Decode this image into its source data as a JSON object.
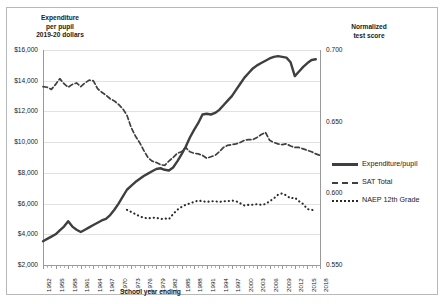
{
  "chart_data": {
    "type": "line",
    "title": "",
    "xlabel": "School year ending",
    "ylabel_left": "Expenditure\nper pupil\n2019-20 dollars",
    "ylabel_right": "Normalized\ntest score",
    "grid": true,
    "legend_position": "right",
    "x_tick_labels": [
      "1952",
      "1955",
      "1958",
      "1961",
      "1964",
      "1967",
      "1970",
      "1973",
      "1976",
      "1979",
      "1982",
      "1985",
      "1988",
      "1991",
      "1994",
      "1997",
      "2000",
      "2003",
      "2006",
      "2009",
      "2012",
      "2015",
      "2018"
    ],
    "xlim": [
      1952,
      2018
    ],
    "ylim_left": [
      2000,
      16000
    ],
    "ylim_right": [
      0.55,
      0.7
    ],
    "y_tick_labels_left": [
      "$16,000",
      "$14,000",
      "$12,000",
      "$10,000",
      "$8,000",
      "$6,000",
      "$4,000",
      "$2,000"
    ],
    "y_tick_values_left": [
      16000,
      14000,
      12000,
      10000,
      8000,
      6000,
      4000,
      2000
    ],
    "y_tick_labels_right": [
      "0.700",
      "0.650",
      "0.600",
      "0.550"
    ],
    "y_tick_values_right": [
      0.7,
      0.65,
      0.6,
      0.55
    ],
    "series": [
      {
        "name": "Expenditure/pupil",
        "axis": "left",
        "style": "solid",
        "color": "#3f3f3f",
        "x": [
          1952,
          1953,
          1954,
          1955,
          1956,
          1957,
          1958,
          1959,
          1960,
          1961,
          1962,
          1963,
          1964,
          1965,
          1966,
          1967,
          1968,
          1969,
          1970,
          1971,
          1972,
          1973,
          1974,
          1975,
          1976,
          1977,
          1978,
          1979,
          1980,
          1981,
          1982,
          1983,
          1984,
          1985,
          1986,
          1987,
          1988,
          1989,
          1990,
          1991,
          1992,
          1993,
          1994,
          1995,
          1996,
          1997,
          1998,
          1999,
          2000,
          2001,
          2002,
          2003,
          2004,
          2005,
          2006,
          2007,
          2008,
          2009,
          2010,
          2011,
          2012,
          2013,
          2014,
          2015,
          2016,
          2017
        ],
        "values": [
          3550,
          3700,
          3850,
          4000,
          4250,
          4500,
          4850,
          4500,
          4300,
          4150,
          4300,
          4450,
          4600,
          4750,
          4900,
          5000,
          5250,
          5600,
          6000,
          6450,
          6900,
          7150,
          7400,
          7600,
          7800,
          7950,
          8100,
          8250,
          8300,
          8200,
          8150,
          8350,
          8750,
          9200,
          9700,
          10300,
          10800,
          11250,
          11800,
          11850,
          11800,
          11900,
          12100,
          12400,
          12700,
          13000,
          13400,
          13800,
          14200,
          14500,
          14800,
          15000,
          15150,
          15300,
          15450,
          15550,
          15600,
          15550,
          15500,
          15200,
          14300,
          14600,
          14900,
          15150,
          15350,
          15400
        ]
      },
      {
        "name": "SAT Total",
        "axis": "right",
        "style": "dashed",
        "color": "#3f3f3f",
        "x": [
          1952,
          1953,
          1954,
          1955,
          1956,
          1957,
          1958,
          1959,
          1960,
          1961,
          1962,
          1963,
          1964,
          1965,
          1966,
          1967,
          1968,
          1969,
          1970,
          1971,
          1972,
          1973,
          1974,
          1975,
          1976,
          1977,
          1978,
          1979,
          1980,
          1981,
          1982,
          1983,
          1984,
          1985,
          1986,
          1987,
          1988,
          1989,
          1990,
          1991,
          1992,
          1993,
          1994,
          1995,
          1996,
          1997,
          1998,
          1999,
          2000,
          2001,
          2002,
          2003,
          2004,
          2005,
          2006,
          2007,
          2008,
          2009,
          2010,
          2011,
          2012,
          2013,
          2014,
          2015,
          2016,
          2017,
          2018
        ],
        "values": [
          0.6745,
          0.674,
          0.6725,
          0.676,
          0.68,
          0.6765,
          0.674,
          0.676,
          0.677,
          0.6745,
          0.677,
          0.679,
          0.6785,
          0.673,
          0.6705,
          0.6685,
          0.666,
          0.6645,
          0.662,
          0.659,
          0.6545,
          0.646,
          0.64,
          0.6355,
          0.63,
          0.625,
          0.6225,
          0.6215,
          0.62,
          0.6195,
          0.6225,
          0.625,
          0.628,
          0.629,
          0.632,
          0.629,
          0.628,
          0.6275,
          0.6265,
          0.6245,
          0.6255,
          0.6265,
          0.629,
          0.632,
          0.6335,
          0.634,
          0.6345,
          0.6355,
          0.637,
          0.6375,
          0.6375,
          0.639,
          0.641,
          0.6425,
          0.637,
          0.6355,
          0.6345,
          0.634,
          0.6345,
          0.633,
          0.632,
          0.632,
          0.631,
          0.63,
          0.629,
          0.6275,
          0.6265
        ]
      },
      {
        "name": "NAEP 12th Grade",
        "axis": "right",
        "style": "dotted",
        "color": "#2a2a2a",
        "x": [
          1972,
          1973,
          1974,
          1975,
          1976,
          1977,
          1978,
          1979,
          1980,
          1981,
          1982,
          1983,
          1984,
          1985,
          1986,
          1987,
          1988,
          1989,
          1990,
          1991,
          1992,
          1993,
          1994,
          1995,
          1996,
          1997,
          1998,
          1999,
          2000,
          2001,
          2002,
          2003,
          2004,
          2005,
          2006,
          2007,
          2008,
          2009,
          2010,
          2011,
          2012,
          2013,
          2014,
          2015,
          2016,
          2017
        ],
        "values": [
          0.5885,
          0.587,
          0.5855,
          0.584,
          0.583,
          0.5825,
          0.583,
          0.583,
          0.582,
          0.5825,
          0.582,
          0.5855,
          0.5885,
          0.5905,
          0.592,
          0.593,
          0.594,
          0.595,
          0.5945,
          0.594,
          0.5945,
          0.5945,
          0.594,
          0.5945,
          0.5945,
          0.595,
          0.5945,
          0.593,
          0.5915,
          0.592,
          0.592,
          0.5925,
          0.592,
          0.5925,
          0.5945,
          0.5965,
          0.599,
          0.6,
          0.5985,
          0.5965,
          0.597,
          0.5945,
          0.5925,
          0.589,
          0.5885,
          0.588
        ]
      }
    ]
  },
  "legend": {
    "items": [
      {
        "label": "Expenditure/pupil",
        "style": "solid"
      },
      {
        "label": "SAT Total",
        "style": "dashed"
      },
      {
        "label": "NAEP 12th Grade",
        "style": "dotted"
      }
    ]
  }
}
